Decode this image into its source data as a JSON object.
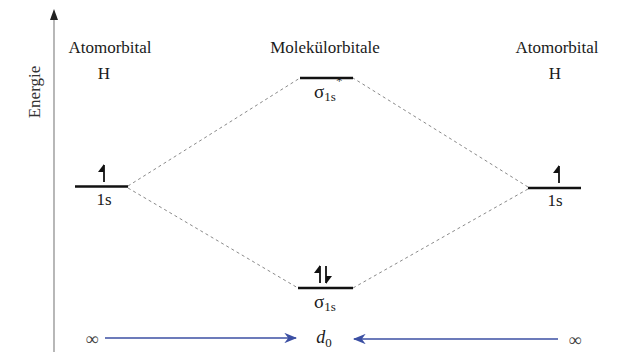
{
  "axis": {
    "label": "Energie"
  },
  "left_atom": {
    "title": "Atomorbital",
    "element": "H",
    "orbital": "1s",
    "electrons": "up"
  },
  "right_atom": {
    "title": "Atomorbital",
    "element": "H",
    "orbital": "1s",
    "electrons": "up"
  },
  "molecule": {
    "title": "Molekülorbitale",
    "antibonding": {
      "symbol": "σ",
      "subscript": "1s",
      "superscript": "*",
      "electrons": "none"
    },
    "bonding": {
      "symbol": "σ",
      "subscript": "1s",
      "electrons": "up-down"
    }
  },
  "distance_axis": {
    "left": "∞",
    "center": "d",
    "center_sub": "0",
    "right": "∞"
  },
  "colors": {
    "level_line": "#111111",
    "dashed": "#8a8a8a",
    "arrow": "#3b4fa3",
    "axis": "#888888"
  }
}
